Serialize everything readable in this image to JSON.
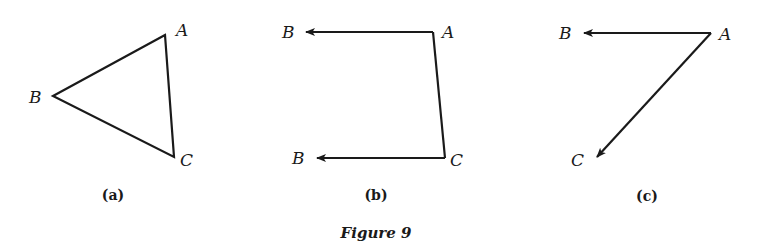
{
  "figure": {
    "caption": "Figure 9",
    "colors": {
      "ink": "#1a1a1a",
      "background": "#ffffff"
    },
    "panels": [
      {
        "id": "a",
        "label": "(a)",
        "type": "triangle",
        "points": {
          "A": {
            "label": "A",
            "x": 165,
            "y": 35
          },
          "B": {
            "label": "B",
            "x": 53,
            "y": 96
          },
          "C": {
            "label": "C",
            "x": 174,
            "y": 157
          }
        },
        "edges": [
          [
            "A",
            "B"
          ],
          [
            "B",
            "C"
          ],
          [
            "C",
            "A"
          ]
        ]
      },
      {
        "id": "b",
        "label": "(b)",
        "type": "vector-pair",
        "points": {
          "A": {
            "label": "A",
            "x": 433,
            "y": 32
          },
          "B1": {
            "label": "B",
            "x": 306,
            "y": 32
          },
          "C": {
            "label": "C",
            "x": 445,
            "y": 158
          },
          "B2": {
            "label": "B",
            "x": 317,
            "y": 158
          }
        },
        "edges": [
          [
            "A",
            "C"
          ]
        ],
        "arrows": [
          [
            "A",
            "B1"
          ],
          [
            "C",
            "B2"
          ]
        ]
      },
      {
        "id": "c",
        "label": "(c)",
        "type": "vector-pair",
        "points": {
          "A": {
            "label": "A",
            "x": 711,
            "y": 33
          },
          "B": {
            "label": "B",
            "x": 584,
            "y": 33
          },
          "C": {
            "label": "C",
            "x": 597,
            "y": 157
          }
        },
        "arrows": [
          [
            "A",
            "B"
          ],
          [
            "A",
            "C"
          ]
        ]
      }
    ]
  }
}
